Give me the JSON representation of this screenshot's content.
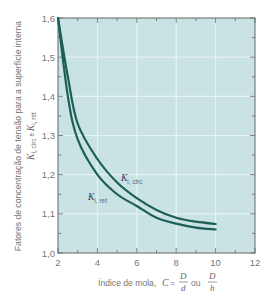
{
  "chart_data": {
    "type": "line",
    "title": "",
    "xlabel": "Índice de mola, C = D/d ou D/h",
    "xlabel_parts": {
      "prefix": "Índice de mola, ",
      "var": "C",
      "eq": " = ",
      "frac1_num": "D",
      "frac1_den": "d",
      "ou": " ou ",
      "frac2_num": "D",
      "frac2_den": "h"
    },
    "ylabel": "Fatores de concentração de tensão para a superfície interna K_i,circ e K_i,ret",
    "ylabel_line1": "Fatores de concentração de tensão para a superfície interna",
    "ylabel_line2_parts": {
      "K1": "K",
      "K1_sub": "i, circ",
      "e": " e ",
      "K2": "K",
      "K2_sub": "i, ret"
    },
    "xlim": [
      2,
      12
    ],
    "ylim": [
      1.0,
      1.6
    ],
    "x_ticks": [
      2,
      4,
      6,
      8,
      10,
      12
    ],
    "x_tick_labels": [
      "2",
      "4",
      "6",
      "8",
      "10",
      "12"
    ],
    "y_ticks": [
      1.0,
      1.1,
      1.2,
      1.3,
      1.4,
      1.5,
      1.6
    ],
    "y_tick_labels": [
      "1,0",
      "1,1",
      "1,2",
      "1,3",
      "1,4",
      "1,5",
      "1,6"
    ],
    "grid": true,
    "legend": "inline labels",
    "x": [
      2,
      2.5,
      3,
      4,
      5,
      6,
      7,
      8,
      9,
      10
    ],
    "series": [
      {
        "name": "K_i,circ",
        "label_main": "K",
        "label_sub": "i, circ",
        "values": [
          1.6,
          1.45,
          1.33,
          1.24,
          1.18,
          1.14,
          1.11,
          1.09,
          1.08,
          1.074
        ]
      },
      {
        "name": "K_i,ret",
        "label_main": "K",
        "label_sub": "i, ret",
        "values": [
          1.6,
          1.4,
          1.29,
          1.2,
          1.15,
          1.12,
          1.09,
          1.075,
          1.065,
          1.06
        ]
      }
    ]
  },
  "colors": {
    "plot_background": "#c9e3e4",
    "grid": "#e6f3f3",
    "axis": "#666666",
    "curve": "#1d5e57"
  }
}
